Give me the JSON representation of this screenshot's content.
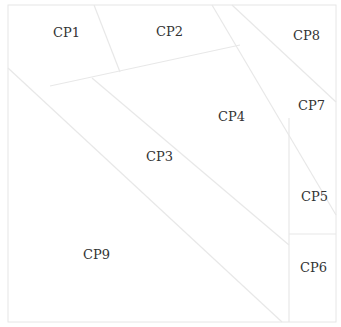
{
  "diagram": {
    "frame": {
      "x": 8,
      "y": 5,
      "width": 328,
      "height": 317,
      "stroke": "#e6e6e6"
    },
    "line_color": "#e8e8e8",
    "label_color": "#333333",
    "regions": [
      {
        "id": "cp1",
        "label": "CP1",
        "x": 53,
        "y": 37
      },
      {
        "id": "cp2",
        "label": "CP2",
        "x": 156,
        "y": 36
      },
      {
        "id": "cp8",
        "label": "CP8",
        "x": 293,
        "y": 40
      },
      {
        "id": "cp7",
        "label": "CP7",
        "x": 298,
        "y": 110
      },
      {
        "id": "cp4",
        "label": "CP4",
        "x": 218,
        "y": 121
      },
      {
        "id": "cp3",
        "label": "CP3",
        "x": 146,
        "y": 161
      },
      {
        "id": "cp5",
        "label": "CP5",
        "x": 301,
        "y": 201
      },
      {
        "id": "cp9",
        "label": "CP9",
        "x": 83,
        "y": 259
      },
      {
        "id": "cp6",
        "label": "CP6",
        "x": 300,
        "y": 272
      }
    ]
  }
}
